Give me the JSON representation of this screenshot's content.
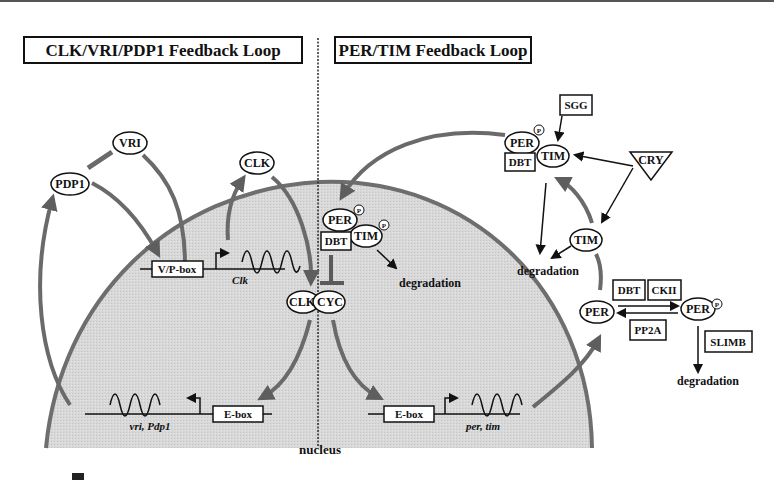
{
  "diagram": {
    "panels": {
      "left_title": "CLK/VRI/PDP1 Feedback Loop",
      "right_title": "PER/TIM Feedback Loop"
    },
    "compartment_label": "nucleus",
    "left_loop": {
      "proteins": {
        "vri": "VRI",
        "pdp1": "PDP1",
        "clk_cyto": "CLK"
      },
      "promoter_top": {
        "box": "V/P-box",
        "gene": "Clk"
      },
      "promoter_bottom": {
        "box": "E-box",
        "gene": "vri, Pdp1"
      },
      "complex": {
        "clk": "CLK",
        "cyc": "CYC"
      }
    },
    "right_loop": {
      "nuclear_complex": {
        "per": "PER",
        "tim": "TIM",
        "kinase": "DBT",
        "phospho": "P",
        "fate": "degradation"
      },
      "promoter": {
        "box": "E-box",
        "gene": "per, tim"
      },
      "cyto_complex": {
        "per": "PER",
        "tim": "TIM",
        "kinase": "DBT",
        "phospho": "P",
        "regulator": "SGG"
      },
      "light_sensor": "CRY",
      "free_tim": "TIM",
      "cyto_degradation": "degradation",
      "per_cycle": {
        "per": "PER",
        "per_p": "PER",
        "phospho": "P",
        "kinase_1": "DBT",
        "kinase_2": "CKII",
        "phosphatase": "PP2A",
        "ubiquitin_ligase": "SLIMB",
        "fate": "degradation"
      }
    },
    "caption_partial": "図 ... (cropped caption, illegible)",
    "colors": {
      "nucleus_fill": "#d9d9d9",
      "nucleus_border": "#6e6e6e",
      "thick_arrow": "#6a6a6a",
      "thin_line": "#111111",
      "box_border": "#111111"
    }
  }
}
